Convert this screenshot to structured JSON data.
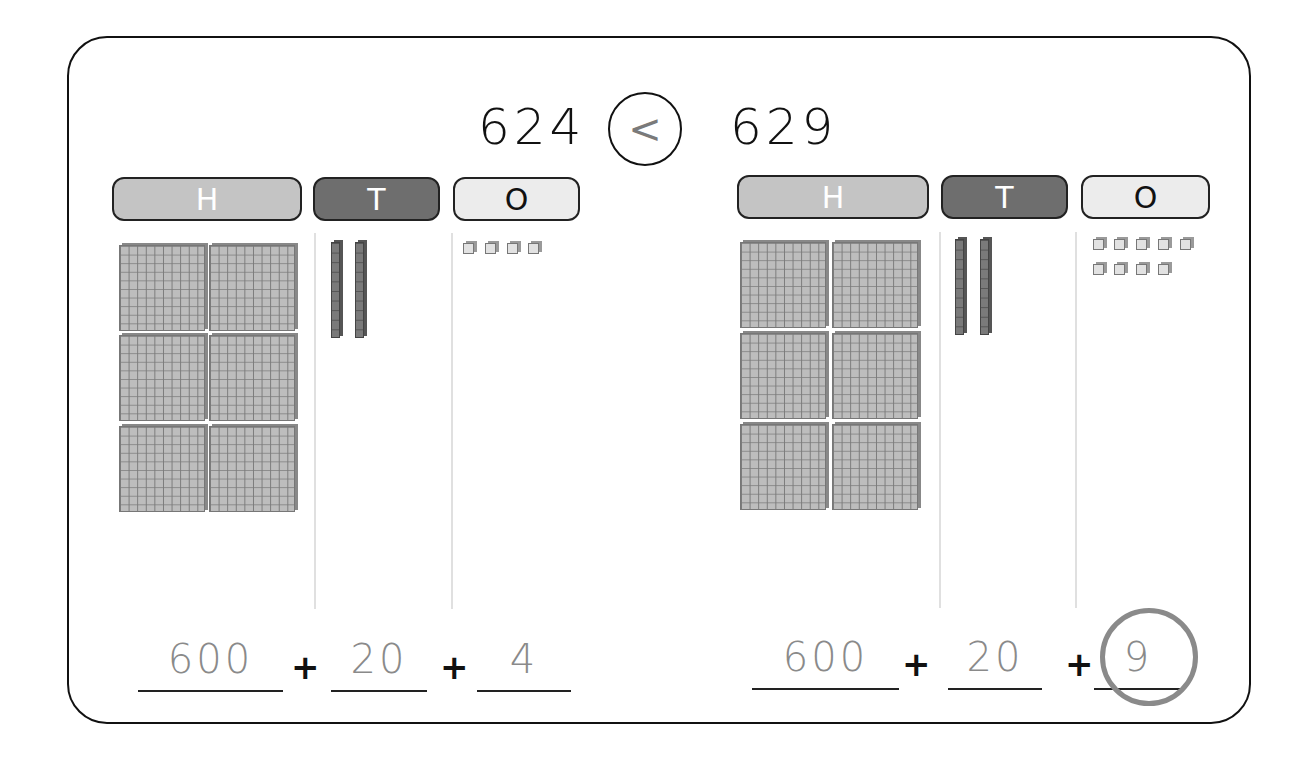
{
  "comparison": {
    "left_number": "624",
    "symbol": "<",
    "right_number": "629"
  },
  "place_value_headers": [
    "H",
    "T",
    "O"
  ],
  "left_model": {
    "number": 624,
    "hundreds_blocks": 6,
    "tens_rods": 2,
    "ones_cubes": 4,
    "expanded_form": {
      "hundreds": "600",
      "tens": "20",
      "ones": "4"
    }
  },
  "right_model": {
    "number": 629,
    "hundreds_blocks": 6,
    "tens_rods": 2,
    "ones_cubes": 9,
    "expanded_form": {
      "hundreds": "600",
      "tens": "20",
      "ones": "9"
    },
    "circled_part": "ones"
  },
  "plus_sign": "+",
  "colors": {
    "hundreds_header": "#c4c4c4",
    "tens_header": "#6e6e6e",
    "ones_header": "#ececec",
    "expanded_digits": "#8a8a8a",
    "comparison_symbol": "#7a7a7a"
  }
}
